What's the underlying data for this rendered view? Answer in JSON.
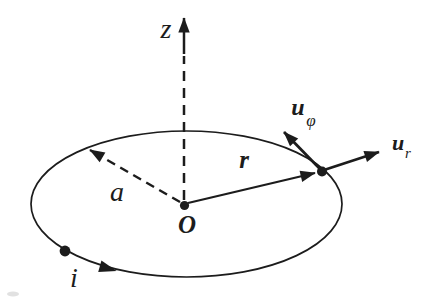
{
  "colors": {
    "background": "#ffffff",
    "ink": "#1c1c1c"
  },
  "labels": {
    "z_axis": "z",
    "origin": "O",
    "radius": "a",
    "position_vector": "r",
    "current": "i",
    "u_phi": {
      "base": "u",
      "sub": "φ"
    },
    "u_r": {
      "base": "u",
      "sub": "r"
    }
  }
}
